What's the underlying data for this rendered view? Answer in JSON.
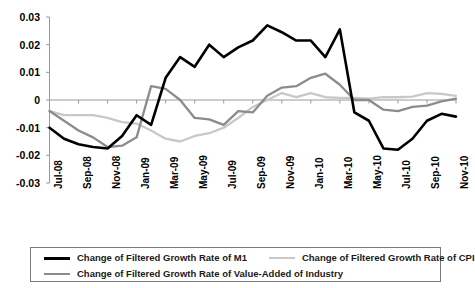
{
  "chart_data": {
    "type": "line",
    "title": "",
    "xlabel": "",
    "ylabel": "",
    "ylim": [
      -0.03,
      0.03
    ],
    "yticks": [
      "0.03",
      "0.02",
      "0.01",
      "0",
      "-0.01",
      "-0.02",
      "-0.03"
    ],
    "ytick_values": [
      0.03,
      0.02,
      0.01,
      0,
      -0.01,
      -0.02,
      -0.03
    ],
    "grid": false,
    "legend_position": "bottom",
    "x": [
      "Jul-08",
      "Aug-08",
      "Sep-08",
      "Oct-08",
      "Nov-08",
      "Dec-08",
      "Jan-09",
      "Feb-09",
      "Mar-09",
      "Apr-09",
      "May-09",
      "Jun-09",
      "Jul-09",
      "Aug-09",
      "Sep-09",
      "Oct-09",
      "Nov-09",
      "Dec-09",
      "Jan-10",
      "Feb-10",
      "Mar-10",
      "Apr-10",
      "May-10",
      "Jun-10",
      "Jul-10",
      "Aug-10",
      "Sep-10",
      "Oct-10",
      "Nov-10"
    ],
    "xtick_labels": [
      "Jul-08",
      "Sep-08",
      "Nov-08",
      "Jan-09",
      "Mar-09",
      "May-09",
      "Jul-09",
      "Sep-09",
      "Nov-09",
      "Jan-10",
      "Mar-10",
      "May-10",
      "Jul-10",
      "Sep-10",
      "Nov-10"
    ],
    "series": [
      {
        "name": "Change of Filtered Growth Rate of M1",
        "color": "#000000",
        "width": 2.6,
        "values": [
          -0.01,
          -0.014,
          -0.016,
          -0.017,
          -0.0175,
          -0.013,
          -0.0055,
          -0.009,
          0.008,
          0.0155,
          0.012,
          0.02,
          0.0155,
          0.019,
          0.0215,
          0.027,
          0.0245,
          0.0215,
          0.0215,
          0.0155,
          0.0255,
          -0.0045,
          -0.0075,
          -0.0175,
          -0.018,
          -0.014,
          -0.0075,
          -0.005,
          -0.006
        ]
      },
      {
        "name": "Change of Filtered Growth Rate of Value-Added of Industry",
        "color": "#8c8c8c",
        "width": 2.3,
        "values": [
          -0.004,
          -0.0075,
          -0.011,
          -0.0135,
          -0.017,
          -0.0165,
          -0.0135,
          0.005,
          0.004,
          0.0,
          -0.0065,
          -0.007,
          -0.009,
          -0.004,
          -0.0045,
          0.0015,
          0.0045,
          0.005,
          0.008,
          0.0095,
          0.0055,
          0.0,
          0.0,
          -0.0035,
          -0.004,
          -0.0025,
          -0.002,
          -0.0005,
          0.0005
        ]
      },
      {
        "name": "Change of Filtered Growth Rate of CPI",
        "color": "#c8c8c8",
        "width": 2.3,
        "values": [
          -0.004,
          -0.0055,
          -0.0055,
          -0.0055,
          -0.0065,
          -0.008,
          -0.0085,
          -0.011,
          -0.014,
          -0.015,
          -0.013,
          -0.012,
          -0.01,
          -0.0065,
          -0.0025,
          0.0,
          0.0025,
          0.001,
          0.0025,
          0.001,
          0.0008,
          0.0008,
          0.0005,
          0.001,
          0.001,
          0.0012,
          0.0025,
          0.0022,
          0.0015
        ]
      }
    ]
  },
  "legend": {
    "items": [
      {
        "label": "Change of Filtered Growth Rate of M1",
        "style": "sw-m1"
      },
      {
        "label": "Change of Filtered Growth Rate of CPI",
        "style": "sw-cpi"
      },
      {
        "label": "Change of Filtered Growth Rate of Value-Added of Industry",
        "style": "sw-ind"
      }
    ]
  }
}
